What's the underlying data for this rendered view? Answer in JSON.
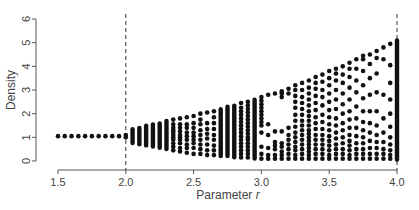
{
  "chart_data": {
    "type": "scatter",
    "title": "",
    "xlabel": "Parameter r",
    "ylabel": "Density",
    "xlim": [
      1.5,
      4.0
    ],
    "ylim": [
      0,
      6
    ],
    "xticks": [
      "1.5",
      "2.0",
      "2.5",
      "3.0",
      "3.5",
      "4.0"
    ],
    "yticks": [
      "0",
      "1",
      "2",
      "3",
      "4",
      "5",
      "6"
    ],
    "grid": false,
    "legend": null,
    "annotations": [
      {
        "type": "vline",
        "x": 2.0,
        "style": "dashed"
      },
      {
        "type": "vline",
        "x": 4.0,
        "style": "dashed"
      }
    ],
    "columns": [
      {
        "r": 1.5,
        "y": [
          1.05
        ]
      },
      {
        "r": 1.55,
        "y": [
          1.05
        ]
      },
      {
        "r": 1.6,
        "y": [
          1.05
        ]
      },
      {
        "r": 1.65,
        "y": [
          1.05
        ]
      },
      {
        "r": 1.7,
        "y": [
          1.05
        ]
      },
      {
        "r": 1.75,
        "y": [
          1.05
        ]
      },
      {
        "r": 1.8,
        "y": [
          1.05
        ]
      },
      {
        "r": 1.85,
        "y": [
          1.05
        ]
      },
      {
        "r": 1.9,
        "y": [
          1.05
        ]
      },
      {
        "r": 1.95,
        "y": [
          1.05
        ]
      },
      {
        "r": 2.0,
        "y": [
          1.0,
          1.1
        ]
      },
      {
        "r": 2.05,
        "band": [
          0.75,
          1.35
        ]
      },
      {
        "r": 2.1,
        "band": [
          0.7,
          1.4
        ]
      },
      {
        "r": 2.15,
        "band": [
          0.65,
          1.5
        ]
      },
      {
        "r": 2.2,
        "band": [
          0.6,
          1.55
        ]
      },
      {
        "r": 2.25,
        "band": [
          0.55,
          1.6
        ]
      },
      {
        "r": 2.3,
        "band": [
          0.5,
          1.7
        ]
      },
      {
        "r": 2.35,
        "y": [
          0.45,
          0.6,
          0.75,
          0.9,
          1.0,
          1.1,
          1.2,
          1.3,
          1.4,
          1.55,
          1.75
        ]
      },
      {
        "r": 2.4,
        "y": [
          0.4,
          0.55,
          0.75,
          0.9,
          1.0,
          1.1,
          1.25,
          1.4,
          1.55,
          1.8
        ]
      },
      {
        "r": 2.45,
        "y": [
          0.35,
          0.55,
          0.7,
          0.9,
          1.05,
          1.2,
          1.4,
          1.55,
          1.85
        ]
      },
      {
        "r": 2.5,
        "y": [
          0.3,
          0.55,
          0.75,
          0.9,
          1.05,
          1.2,
          1.4,
          1.6,
          1.9
        ]
      },
      {
        "r": 2.55,
        "y": [
          0.3,
          0.5,
          0.7,
          0.9,
          1.1,
          1.3,
          1.55,
          1.75,
          2.0
        ]
      },
      {
        "r": 2.6,
        "y": [
          0.25,
          0.45,
          0.7,
          0.95,
          1.15,
          1.35,
          1.6,
          2.05
        ]
      },
      {
        "r": 2.65,
        "y": [
          0.25,
          0.45,
          0.65,
          0.9,
          1.1,
          1.35,
          1.6,
          1.85,
          2.1
        ]
      },
      {
        "r": 2.7,
        "band": [
          0.2,
          2.2
        ]
      },
      {
        "r": 2.75,
        "band": [
          0.2,
          2.3
        ]
      },
      {
        "r": 2.8,
        "band": [
          0.15,
          2.35
        ]
      },
      {
        "r": 2.85,
        "y": [
          0.15,
          0.3,
          0.45,
          0.6,
          0.75,
          0.9,
          1.05,
          1.2,
          1.35,
          1.5,
          1.65,
          1.8,
          1.95,
          2.1,
          2.25,
          2.45
        ]
      },
      {
        "r": 2.9,
        "y": [
          0.15,
          0.3,
          0.45,
          0.6,
          0.75,
          0.9,
          1.0,
          1.15,
          1.3,
          1.45,
          1.6,
          1.75,
          1.9,
          2.05,
          2.2,
          2.35,
          2.5
        ]
      },
      {
        "r": 2.95,
        "band": [
          0.1,
          2.6
        ]
      },
      {
        "r": 3.0,
        "y": [
          0.1,
          0.3,
          0.6,
          1.2,
          1.5,
          1.65,
          1.8,
          1.95,
          2.1,
          2.25,
          2.4,
          2.55,
          2.7
        ]
      },
      {
        "r": 3.05,
        "y": [
          0.1,
          0.25,
          0.55,
          1.1,
          1.55,
          2.8
        ]
      },
      {
        "r": 3.1,
        "y": [
          0.1,
          0.25,
          0.5,
          0.65,
          0.8,
          1.25,
          2.85
        ]
      },
      {
        "r": 3.15,
        "y": [
          0.1,
          0.25,
          0.4,
          0.6,
          0.75,
          1.25,
          2.7,
          2.85,
          2.95
        ]
      },
      {
        "r": 3.2,
        "y": [
          0.1,
          0.3,
          0.5,
          0.7,
          0.9,
          1.1,
          1.4,
          2.85,
          3.05
        ]
      },
      {
        "r": 3.25,
        "y": [
          0.1,
          0.25,
          0.45,
          0.6,
          0.8,
          1.0,
          1.2,
          1.45,
          1.7,
          1.95,
          2.25,
          2.5,
          2.75,
          3.0,
          3.2
        ]
      },
      {
        "r": 3.3,
        "y": [
          0.1,
          0.3,
          0.5,
          0.7,
          0.9,
          1.1,
          1.3,
          1.5,
          1.7,
          1.95,
          2.2,
          2.45,
          2.7,
          3.0,
          3.3
        ]
      },
      {
        "r": 3.35,
        "y": [
          0.1,
          0.25,
          0.4,
          0.55,
          0.7,
          0.85,
          1.0,
          1.15,
          1.3,
          1.5,
          1.7,
          1.9,
          2.1,
          2.35,
          2.6,
          2.85,
          3.1,
          3.4
        ]
      },
      {
        "r": 3.4,
        "y": [
          0.1,
          0.3,
          0.5,
          0.7,
          0.9,
          1.1,
          1.35,
          1.6,
          1.85,
          2.15,
          2.45,
          2.75,
          3.05,
          3.3,
          3.55
        ]
      },
      {
        "r": 3.45,
        "y": [
          0.1,
          0.3,
          0.5,
          0.7,
          0.9,
          1.1,
          1.35,
          1.65,
          1.95,
          2.35,
          2.7,
          3.0,
          3.35,
          3.65
        ]
      },
      {
        "r": 3.5,
        "y": [
          0.1,
          0.25,
          0.45,
          0.65,
          0.85,
          1.05,
          1.3,
          1.55,
          1.85,
          2.15,
          2.5,
          2.85,
          3.2,
          3.5,
          3.8
        ]
      },
      {
        "r": 3.55,
        "y": [
          0.1,
          0.3,
          0.5,
          0.7,
          0.95,
          1.2,
          1.5,
          1.8,
          2.2,
          2.6,
          3.0,
          3.4,
          3.7,
          3.9
        ]
      },
      {
        "r": 3.6,
        "y": [
          0.1,
          0.3,
          0.5,
          0.75,
          1.0,
          1.3,
          1.6,
          2.0,
          2.4,
          2.85,
          3.3,
          3.65,
          4.0
        ]
      },
      {
        "r": 3.65,
        "y": [
          0.1,
          0.25,
          0.45,
          0.65,
          0.85,
          1.1,
          1.4,
          1.75,
          2.1,
          2.6,
          3.1,
          3.55,
          3.9,
          4.15
        ]
      },
      {
        "r": 3.7,
        "y": [
          0.1,
          0.3,
          0.5,
          0.75,
          1.05,
          1.4,
          1.8,
          2.3,
          2.9,
          3.4,
          3.9,
          4.3
        ]
      },
      {
        "r": 3.75,
        "y": [
          0.1,
          0.3,
          0.5,
          0.75,
          1.0,
          1.3,
          1.65,
          2.1,
          2.65,
          3.2,
          3.8,
          4.3,
          4.45
        ]
      },
      {
        "r": 3.8,
        "y": [
          0.1,
          0.3,
          0.55,
          0.85,
          1.2,
          1.6,
          2.1,
          2.8,
          3.5,
          4.1,
          4.5
        ]
      },
      {
        "r": 3.85,
        "y": [
          0.1,
          0.3,
          0.55,
          0.8,
          1.1,
          1.5,
          2.1,
          2.9,
          3.7,
          4.35,
          4.65
        ]
      },
      {
        "r": 3.9,
        "y": [
          0.1,
          0.3,
          0.5,
          0.8,
          1.2,
          1.8,
          2.8,
          4.3,
          4.8
        ]
      },
      {
        "r": 3.95,
        "y": [
          0.1,
          0.25,
          0.45,
          0.7,
          1.0,
          1.45,
          2.0,
          2.6,
          3.3,
          4.05,
          4.95
        ]
      },
      {
        "r": 4.0,
        "band": [
          0.05,
          5.1
        ]
      }
    ]
  }
}
